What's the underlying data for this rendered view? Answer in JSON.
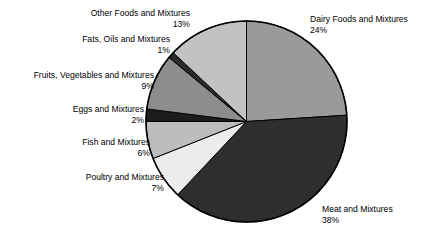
{
  "chart_data": {
    "type": "pie",
    "title": "",
    "subtitle": "",
    "xlabel": "",
    "ylabel": "",
    "legend_position": "callout-labels",
    "grid": false,
    "start_angle_deg": 0,
    "direction": "clockwise",
    "units": "percent",
    "categories": [
      "Dairy Foods and Mixtures",
      "Meat and Mixtures",
      "Poultry and Mixtures",
      "Fish and Mixtures",
      "Eggs and Mixtures",
      "Fruits, Vegetables and Mixtures",
      "Fats, Oils and Mixtures",
      "Other Foods and Mixtures"
    ],
    "values": [
      24,
      38,
      7,
      6,
      2,
      9,
      1,
      13
    ],
    "value_labels": [
      "24%",
      "38%",
      "7%",
      "6%",
      "2%",
      "9%",
      "1%",
      "13%"
    ],
    "colors": [
      "#9a9a9a",
      "#2e2e2e",
      "#ececec",
      "#bdbdbd",
      "#1c1c1c",
      "#8d8d8d",
      "#2b2b2b",
      "#c2c2c2"
    ],
    "slice_outline_color": "#000000",
    "background_color": "#ffffff"
  },
  "slices": [
    {
      "name": "dairy",
      "label": "Dairy Foods and Mixtures",
      "percent_label": "24%",
      "value": 24,
      "color": "#9a9a9a"
    },
    {
      "name": "meat",
      "label": "Meat and Mixtures",
      "percent_label": "38%",
      "value": 38,
      "color": "#2e2e2e"
    },
    {
      "name": "poultry",
      "label": "Poultry and Mixtures",
      "percent_label": "7%",
      "value": 7,
      "color": "#ececec"
    },
    {
      "name": "fish",
      "label": "Fish and Mixtures",
      "percent_label": "6%",
      "value": 6,
      "color": "#bdbdbd"
    },
    {
      "name": "eggs",
      "label": "Eggs and Mixtures",
      "percent_label": "2%",
      "value": 2,
      "color": "#1c1c1c"
    },
    {
      "name": "fruits-vegetables",
      "label": "Fruits, Vegetables and Mixtures",
      "percent_label": "9%",
      "value": 9,
      "color": "#8d8d8d"
    },
    {
      "name": "fats-oils",
      "label": "Fats, Oils and Mixtures",
      "percent_label": "1%",
      "value": 1,
      "color": "#2b2b2b"
    },
    {
      "name": "other-foods",
      "label": "Other Foods and Mixtures",
      "percent_label": "13%",
      "value": 13,
      "color": "#c2c2c2"
    }
  ]
}
